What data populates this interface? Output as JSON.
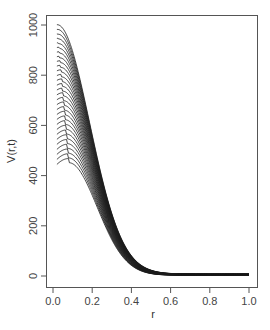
{
  "chart_data": {
    "type": "line",
    "title": "",
    "xlabel": "r",
    "ylabel": "V(r,t)",
    "xlim": [
      0.0,
      1.0
    ],
    "ylim": [
      0,
      1000
    ],
    "grid": false,
    "legend": null,
    "x_ticks": [
      "0.0",
      "0.2",
      "0.4",
      "0.6",
      "0.8",
      "1.0"
    ],
    "y_ticks": [
      "0",
      "200",
      "400",
      "600",
      "800",
      "1000"
    ],
    "series_count": 30,
    "series_description": "Family of 30 curves V(r,t) for successive t; each starts at r≈0.02 with value decreasing evenly from 1000 (top) to ~450 (bottom), all decaying to ~0-10 by r≈0.5 and staying flat to r=1.0",
    "x": [
      0.02,
      0.05,
      0.1,
      0.15,
      0.2,
      0.25,
      0.3,
      0.35,
      0.4,
      0.5,
      0.6,
      0.8,
      1.0
    ],
    "series": [
      {
        "name": "t1",
        "values": [
          1000,
          965,
          850,
          670,
          470,
          295,
          165,
          85,
          40,
          12,
          8,
          8,
          8
        ]
      },
      {
        "name": "t10",
        "values": [
          830,
          815,
          740,
          600,
          435,
          280,
          160,
          82,
          38,
          11,
          7,
          7,
          7
        ]
      },
      {
        "name": "t20",
        "values": [
          640,
          640,
          600,
          510,
          385,
          258,
          150,
          78,
          36,
          9,
          5,
          5,
          5
        ]
      },
      {
        "name": "t30",
        "values": [
          450,
          460,
          450,
          400,
          315,
          220,
          135,
          72,
          33,
          7,
          3,
          3,
          3
        ]
      }
    ],
    "colors": {
      "line": "#1a1a1a",
      "axis": "#555555",
      "background": "#ffffff"
    }
  },
  "axes": {
    "x_label": "r",
    "y_label": "V(r,t)",
    "x_ticks": [
      "0.0",
      "0.2",
      "0.4",
      "0.6",
      "0.8",
      "1.0"
    ],
    "y_ticks": [
      "0",
      "200",
      "400",
      "600",
      "800",
      "1000"
    ]
  }
}
